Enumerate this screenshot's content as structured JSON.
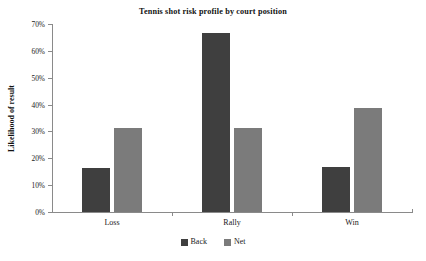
{
  "chart_data": {
    "type": "bar",
    "title": "Tennis shot risk profile by court position",
    "xlabel": "",
    "ylabel": "Likelihood of result",
    "categories": [
      "Loss",
      "Rally",
      "Win"
    ],
    "series": [
      {
        "name": "Back",
        "color": "#3f3f3f",
        "values": [
          16.4,
          66.6,
          16.8
        ]
      },
      {
        "name": "Net",
        "color": "#7b7b7b",
        "values": [
          31.3,
          31.3,
          38.7
        ]
      }
    ],
    "ylim": [
      0,
      70
    ],
    "ytick_values": [
      0,
      10,
      20,
      30,
      40,
      50,
      60,
      70
    ],
    "ytick_labels": [
      "0%",
      "10%",
      "20%",
      "30%",
      "40%",
      "50%",
      "60%",
      "70%"
    ],
    "grid": false,
    "legend_position": "bottom",
    "axis_color": "#8a8a8a",
    "background": "#ffffff"
  }
}
